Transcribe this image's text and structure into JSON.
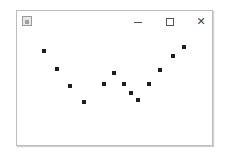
{
  "window": {
    "title": "",
    "controls": {
      "minimize_icon": "minimize-icon",
      "maximize_icon": "maximize-icon",
      "close_label": "✕"
    }
  },
  "chart_data": {
    "type": "scatter",
    "title": "",
    "xlabel": "",
    "ylabel": "",
    "grid": false,
    "legend": null,
    "points_px": [
      {
        "x": 44,
        "y": 51
      },
      {
        "x": 57,
        "y": 69
      },
      {
        "x": 70,
        "y": 86
      },
      {
        "x": 84,
        "y": 102
      },
      {
        "x": 104,
        "y": 84
      },
      {
        "x": 114,
        "y": 73
      },
      {
        "x": 124,
        "y": 84
      },
      {
        "x": 131,
        "y": 93
      },
      {
        "x": 138,
        "y": 100
      },
      {
        "x": 149,
        "y": 84
      },
      {
        "x": 160,
        "y": 70
      },
      {
        "x": 173,
        "y": 56
      },
      {
        "x": 184,
        "y": 47
      }
    ],
    "point_color": "#1e1e1e"
  }
}
